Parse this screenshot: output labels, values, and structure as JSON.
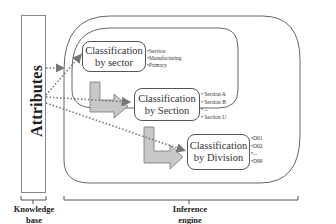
{
  "knowledge_base": {
    "title": "Attributes",
    "caption_line1": "Knowledge",
    "caption_line2": "base"
  },
  "inference_engine": {
    "caption_line1": "Inference",
    "caption_line2": "engine",
    "stages": [
      {
        "label_line1": "Classification",
        "label_line2": "by sector",
        "items": [
          "•Service",
          "•Manufacturing",
          "•Primary"
        ]
      },
      {
        "label_line1": "Classification",
        "label_line2": "by Section",
        "items": [
          "•  Section A",
          "•  Section B",
          "•  ...",
          "•  Section U"
        ]
      },
      {
        "label_line1": "Classification",
        "label_line2": "by Division",
        "items": [
          "•D01",
          "•D02",
          "•...",
          "•D99"
        ]
      }
    ]
  },
  "colors": {
    "line": "#555555",
    "arrow_fill": "#c8c8c8",
    "dotted_arrow": "#777777"
  }
}
